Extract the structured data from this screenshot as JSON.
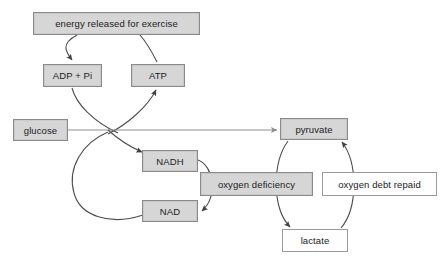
{
  "diagram": {
    "canvas": {
      "width": 441,
      "height": 260,
      "background": "#ffffff"
    },
    "style": {
      "box_fill_gray": "#d6d6d6",
      "box_fill_white": "#fefefe",
      "box_border": "#8a8a8a",
      "arrow_stroke": "#4d4d4d",
      "line_stroke": "#8f8f8f",
      "text_color": "#1c1c1c"
    },
    "nodes": [
      {
        "id": "energy",
        "label": "energy released for exercise",
        "fill": "gray",
        "x": 33,
        "y": 12,
        "w": 167,
        "h": 23
      },
      {
        "id": "adp",
        "label": "ADP + Pi",
        "fill": "gray",
        "x": 43,
        "y": 64,
        "w": 59,
        "h": 23
      },
      {
        "id": "atp",
        "label": "ATP",
        "fill": "gray",
        "x": 131,
        "y": 64,
        "w": 54,
        "h": 23
      },
      {
        "id": "glucose",
        "label": "glucose",
        "fill": "gray",
        "x": 13,
        "y": 119,
        "w": 55,
        "h": 22
      },
      {
        "id": "pyruvate",
        "label": "pyruvate",
        "fill": "gray",
        "x": 280,
        "y": 118,
        "w": 68,
        "h": 22
      },
      {
        "id": "nadh",
        "label": "NADH",
        "fill": "gray",
        "x": 142,
        "y": 150,
        "w": 56,
        "h": 22
      },
      {
        "id": "nad",
        "label": "NAD",
        "fill": "gray",
        "x": 142,
        "y": 200,
        "w": 56,
        "h": 22
      },
      {
        "id": "oxydef",
        "label": "oxygen deficiency",
        "fill": "gray",
        "x": 200,
        "y": 172,
        "w": 113,
        "h": 24
      },
      {
        "id": "oxydebt",
        "label": "oxygen debt repaid",
        "fill": "white",
        "x": 322,
        "y": 172,
        "w": 115,
        "h": 24
      },
      {
        "id": "lactate",
        "label": "lactate",
        "fill": "white",
        "x": 282,
        "y": 229,
        "w": 66,
        "h": 23
      }
    ],
    "edges": [
      {
        "id": "energy-to-adp",
        "from": "energy",
        "to": "adp",
        "kind": "curved-arrow"
      },
      {
        "id": "atp-to-energy",
        "from": "atp",
        "to": "energy",
        "kind": "curved-arrow"
      },
      {
        "id": "adp-to-cross",
        "from": "adp",
        "to": "crossing",
        "kind": "curve"
      },
      {
        "id": "cross-to-atp",
        "from": "crossing",
        "to": "atp",
        "kind": "curved-arrow"
      },
      {
        "id": "glucose-to-pyruvate",
        "from": "glucose",
        "to": "pyruvate",
        "kind": "straight-arrow"
      },
      {
        "id": "cross-to-nadh",
        "from": "crossing",
        "to": "nadh",
        "kind": "curved-arrow"
      },
      {
        "id": "nad-loop-to-cross",
        "from": "nad",
        "to": "crossing",
        "kind": "curve"
      },
      {
        "id": "nadh-to-nad",
        "from": "nadh",
        "to": "nad",
        "kind": "curved-arrow"
      },
      {
        "id": "pyruvate-to-lactate",
        "from": "pyruvate",
        "to": "lactate",
        "kind": "curved-arrow"
      },
      {
        "id": "lactate-to-pyruvate",
        "from": "lactate",
        "to": "pyruvate",
        "kind": "curved-arrow"
      }
    ]
  }
}
